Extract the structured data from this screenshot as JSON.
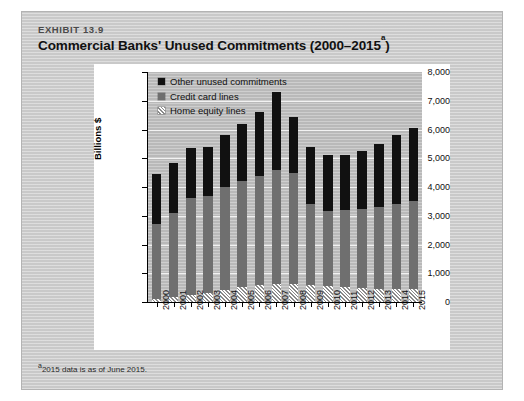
{
  "exhibit": {
    "label": "EXHIBIT 13.9",
    "title": "Commercial Banks' Unused Commitments (2000–2015",
    "title_sup": "a",
    "title_close": ")",
    "footnote_sup": "a",
    "footnote": "2015 data is as of June 2015."
  },
  "legend": {
    "position": "top-left-inside",
    "items": [
      {
        "label": "Other unused commitments",
        "color": "#111111",
        "key": "other"
      },
      {
        "label": "Credit card lines",
        "color": "#6f6f6f",
        "key": "credit"
      },
      {
        "label": "Home equity lines",
        "color": "#ffffff",
        "key": "home"
      }
    ]
  },
  "chart_data": {
    "type": "bar",
    "stacked": true,
    "xlabel": "",
    "ylabel": "Billions $",
    "ylim": [
      0,
      8000
    ],
    "ytick_step": 1000,
    "ytick_labels": [
      "0",
      "1,000",
      "2,000",
      "3,000",
      "4,000",
      "5,000",
      "6,000",
      "7,000",
      "8,000"
    ],
    "grid": true,
    "categories": [
      "2000",
      "2001",
      "2002",
      "2003",
      "2004",
      "2005",
      "2006",
      "2007",
      "2008",
      "2009",
      "2010",
      "2011",
      "2012",
      "2013",
      "2014",
      "2015"
    ],
    "series": [
      {
        "name": "Home equity lines",
        "color": "#ffffff",
        "values": [
          120,
          180,
          250,
          330,
          430,
          520,
          600,
          640,
          620,
          590,
          560,
          530,
          500,
          470,
          450,
          440
        ]
      },
      {
        "name": "Credit card lines",
        "color": "#6f6f6f",
        "values": [
          2580,
          2920,
          3380,
          3370,
          3570,
          3680,
          3800,
          3960,
          3880,
          2810,
          2620,
          2670,
          2750,
          2830,
          2950,
          3060
        ]
      },
      {
        "name": "Other unused commitments",
        "color": "#111111",
        "values": [
          1750,
          1750,
          1720,
          1700,
          1800,
          2000,
          2200,
          2700,
          1950,
          2000,
          1920,
          1900,
          2000,
          2200,
          2400,
          2550
        ]
      }
    ],
    "totals": [
      4450,
      4850,
      5350,
      5400,
      5800,
      6200,
      6600,
      7300,
      6450,
      5400,
      5100,
      5100,
      5250,
      5500,
      5800,
      6050
    ]
  }
}
